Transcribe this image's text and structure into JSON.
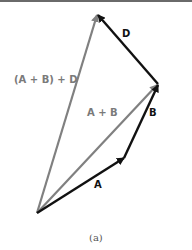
{
  "diagram": {
    "type": "vector-addition",
    "caption": "(a)",
    "colors": {
      "primary": "#111111",
      "resultant": "#808080"
    },
    "vectors": [
      {
        "id": "A",
        "label": "A",
        "from": [
          37,
          213
        ],
        "to": [
          124,
          158
        ],
        "style": "primary"
      },
      {
        "id": "B",
        "label": "B",
        "from": [
          124,
          158
        ],
        "to": [
          158,
          84
        ],
        "style": "primary"
      },
      {
        "id": "D",
        "label": "D",
        "from": [
          158,
          84
        ],
        "to": [
          97,
          14
        ],
        "style": "primary"
      },
      {
        "id": "AB",
        "label": "A + B",
        "from": [
          37,
          213
        ],
        "to": [
          158,
          84
        ],
        "style": "resultant"
      },
      {
        "id": "ABD",
        "label": "(A + B) + D",
        "from": [
          37,
          213
        ],
        "to": [
          97,
          14
        ],
        "style": "resultant"
      }
    ]
  }
}
